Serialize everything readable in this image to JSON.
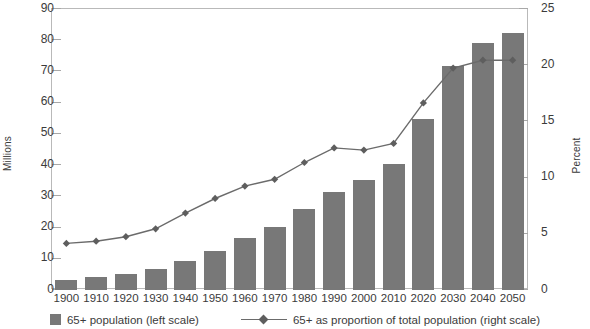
{
  "chart_data": {
    "type": "bar",
    "title": "",
    "categories": [
      "1900",
      "1910",
      "1920",
      "1930",
      "1940",
      "1950",
      "1960",
      "1970",
      "1980",
      "1990",
      "2000",
      "2010",
      "2020",
      "2030",
      "2040",
      "2050"
    ],
    "series": [
      {
        "name": "65+ population (left scale)",
        "axis": "left",
        "type": "bar",
        "unit": "Millions",
        "values": [
          3.1,
          4.0,
          4.9,
          6.6,
          9.0,
          12.3,
          16.6,
          20.1,
          25.7,
          31.2,
          35.0,
          40.2,
          54.6,
          71.5,
          78.9,
          82.0
        ]
      },
      {
        "name": "65+ as proportion of total population (right scale)",
        "axis": "right",
        "type": "line",
        "unit": "Percent",
        "values": [
          4.1,
          4.3,
          4.7,
          5.4,
          6.8,
          8.1,
          9.2,
          9.8,
          11.3,
          12.6,
          12.4,
          13.0,
          16.6,
          19.7,
          20.4,
          20.4
        ]
      }
    ],
    "xlabel": "",
    "ylabel": "Millions",
    "y2label": "Percent",
    "ylim": [
      0,
      90
    ],
    "y2lim": [
      0,
      25
    ],
    "yticks": [
      0,
      10,
      20,
      30,
      40,
      50,
      60,
      70,
      80,
      90
    ],
    "y2ticks": [
      0,
      5,
      10,
      15,
      20,
      25
    ],
    "grid": false,
    "legend_position": "bottom",
    "colors": {
      "bar": "#787878",
      "line": "#6b6b6b",
      "marker": "#5e5e5e",
      "frame": "#b9b9b9"
    }
  },
  "axes": {
    "left_title": "Millions",
    "right_title": "Percent",
    "left_ticks": [
      "90",
      "80",
      "70",
      "60",
      "50",
      "40",
      "30",
      "20",
      "10",
      "0"
    ],
    "right_ticks": [
      "25",
      "20",
      "15",
      "10",
      "5",
      "0"
    ],
    "x_ticks": [
      "1900",
      "1910",
      "1920",
      "1930",
      "1940",
      "1950",
      "1960",
      "1970",
      "1980",
      "1990",
      "2000",
      "2010",
      "2020",
      "2030",
      "2040",
      "2050"
    ]
  },
  "legend": {
    "bar_label": "65+ population (left scale)",
    "line_label": "65+ as proportion of total population (right scale)"
  },
  "top_caption": ""
}
